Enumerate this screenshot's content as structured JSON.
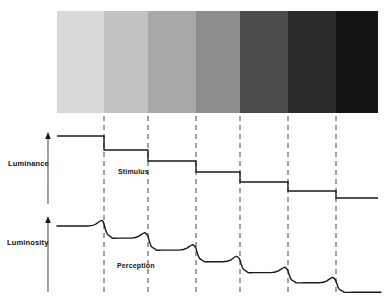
{
  "figure": {
    "width": 387,
    "height": 297,
    "background_color": "#ffffff",
    "ink_color": "#1a1a1a",
    "dash_color": "#555555"
  },
  "labels": {
    "luminance": "Luminance",
    "luminosity": "Luminosity",
    "stimulus": "Stimulus",
    "perception": "Perception"
  },
  "chart_data": {
    "type": "line",
    "xlabel": "",
    "ylabel": "Luminance / Luminosity",
    "grid": false,
    "legend": "none",
    "annotations": [
      "Stimulus",
      "Perception"
    ],
    "bands": {
      "count": 7,
      "x_start": 57,
      "x_end": 378,
      "y_top": 11,
      "y_bottom": 113,
      "band_edges_x": [
        57,
        104,
        148,
        196,
        240,
        288,
        336,
        378
      ],
      "colors": [
        "#d9d9d9",
        "#c2c2c2",
        "#a8a8a8",
        "#8c8c8c",
        "#4a4a4a",
        "#2b2b2b",
        "#141414"
      ],
      "gray_values": [
        217,
        194,
        168,
        140,
        74,
        43,
        20
      ]
    },
    "dashed_edges_x": [
      104,
      148,
      196,
      240,
      288,
      336
    ],
    "stimulus": {
      "name": "Stimulus (luminance)",
      "axis_x": 48,
      "axis_top_y": 134,
      "axis_bottom_y": 204,
      "step_levels_y": [
        136,
        150,
        161,
        172,
        182,
        191,
        198
      ],
      "step_x": [
        57,
        104,
        148,
        196,
        240,
        288,
        336,
        378
      ],
      "step_values": [
        7,
        6,
        5,
        4,
        3,
        2,
        1
      ]
    },
    "perception": {
      "name": "Perception (luminosity)",
      "axis_x": 48,
      "axis_top_y": 218,
      "axis_bottom_y": 292,
      "base_levels_y": [
        226,
        238,
        248,
        258,
        267,
        275,
        282
      ],
      "overshoot_delta": -6,
      "undershoot_delta": 6,
      "description": "Each luminance edge produces a bright overshoot just before the step down and a dark undershoot just after, the classic Mach band response."
    }
  }
}
